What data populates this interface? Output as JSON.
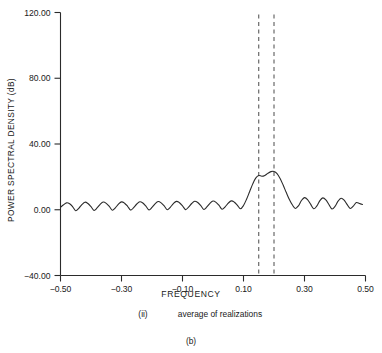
{
  "chart_data": {
    "type": "line",
    "title": "",
    "xlabel": "FREQUENCY",
    "ylabel": "POWER SPECTRAL DENSITY (dB)",
    "xlim": [
      -0.5,
      0.5
    ],
    "ylim": [
      -40.0,
      120.0
    ],
    "grid": false,
    "legend": null,
    "xticks": [
      -0.5,
      -0.3,
      -0.1,
      0.1,
      0.3,
      0.5
    ],
    "xtick_labels": [
      "−0.50",
      "−0.30",
      "−0.10",
      "0.10",
      "0.30",
      "0.50"
    ],
    "yticks": [
      -40.0,
      0.0,
      40.0,
      80.0,
      120.0
    ],
    "ytick_labels": [
      "−40.00",
      "0.00",
      "40.00",
      "80.00",
      "120.00"
    ],
    "annotations": [
      {
        "name": "marker-line-low",
        "type": "vline",
        "x": 0.15,
        "style": "dashed"
      },
      {
        "name": "marker-line-high",
        "type": "vline",
        "x": 0.2,
        "style": "dashed"
      }
    ],
    "series": [
      {
        "name": "average of realizations",
        "x": [
          -0.5,
          -0.49,
          -0.48,
          -0.47,
          -0.46,
          -0.45,
          -0.44,
          -0.43,
          -0.42,
          -0.41,
          -0.4,
          -0.39,
          -0.38,
          -0.37,
          -0.36,
          -0.35,
          -0.34,
          -0.33,
          -0.32,
          -0.31,
          -0.3,
          -0.29,
          -0.28,
          -0.27,
          -0.26,
          -0.25,
          -0.24,
          -0.23,
          -0.22,
          -0.21,
          -0.2,
          -0.19,
          -0.18,
          -0.17,
          -0.16,
          -0.15,
          -0.14,
          -0.13,
          -0.12,
          -0.11,
          -0.1,
          -0.09,
          -0.08,
          -0.07,
          -0.06,
          -0.05,
          -0.04,
          -0.03,
          -0.02,
          -0.01,
          0.0,
          0.01,
          0.02,
          0.03,
          0.04,
          0.05,
          0.06,
          0.07,
          0.08,
          0.09,
          0.1,
          0.11,
          0.12,
          0.13,
          0.14,
          0.15,
          0.16,
          0.17,
          0.18,
          0.19,
          0.2,
          0.21,
          0.22,
          0.23,
          0.24,
          0.25,
          0.26,
          0.27,
          0.28,
          0.29,
          0.3,
          0.31,
          0.32,
          0.33,
          0.34,
          0.35,
          0.36,
          0.37,
          0.38,
          0.39,
          0.4,
          0.41,
          0.42,
          0.43,
          0.44,
          0.45,
          0.46,
          0.47,
          0.48,
          0.49
        ],
        "y": [
          1.5,
          3.0,
          4.2,
          3.6,
          1.8,
          -0.6,
          0.9,
          3.1,
          4.6,
          3.8,
          1.9,
          -0.4,
          1.1,
          3.3,
          4.7,
          3.9,
          2.0,
          -0.3,
          1.2,
          3.4,
          4.8,
          4.0,
          2.1,
          -0.2,
          1.3,
          3.5,
          4.9,
          4.1,
          2.2,
          -0.1,
          1.4,
          3.6,
          5.0,
          4.2,
          2.3,
          0.0,
          1.5,
          3.7,
          5.1,
          4.3,
          2.4,
          0.1,
          1.6,
          3.8,
          5.2,
          4.4,
          2.5,
          0.2,
          1.7,
          3.9,
          5.3,
          4.5,
          2.6,
          0.3,
          1.8,
          4.0,
          5.4,
          4.6,
          2.7,
          0.6,
          2.6,
          6.4,
          11.0,
          15.6,
          19.2,
          20.8,
          20.4,
          20.9,
          22.2,
          23.2,
          23.3,
          22.0,
          19.0,
          15.0,
          10.6,
          6.4,
          3.0,
          0.8,
          2.4,
          5.6,
          7.4,
          6.2,
          3.4,
          0.6,
          2.2,
          5.4,
          7.2,
          6.0,
          3.2,
          0.5,
          2.0,
          5.2,
          7.0,
          5.8,
          3.1,
          0.8,
          2.2,
          4.4,
          3.8,
          3.2
        ]
      }
    ]
  },
  "caption": {
    "subfigure_label": "(ii)",
    "subfigure_text": "average of realizations",
    "figure_label": "(b)"
  }
}
